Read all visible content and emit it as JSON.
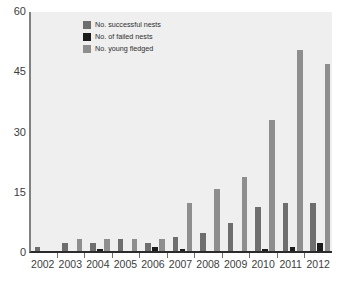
{
  "chart_data": {
    "type": "bar",
    "title": "",
    "subtitle": "",
    "xlabel": "",
    "ylabel": "",
    "ylim": [
      0,
      60
    ],
    "yticks": [
      0,
      15,
      30,
      45,
      60
    ],
    "grid": false,
    "legend_position": "top-left-inside",
    "categories": [
      "2002",
      "2003",
      "2004",
      "2005",
      "2006",
      "2007",
      "2008",
      "2009",
      "2010",
      "2011",
      "2012"
    ],
    "series": [
      {
        "name": "No. successful nests",
        "color": "#6e6e6e",
        "values": [
          1,
          2,
          2,
          3,
          2,
          3.5,
          4.5,
          7,
          11,
          12,
          12
        ]
      },
      {
        "name": "No. of failed nests",
        "color": "#1c1c1c",
        "values": [
          0,
          0,
          0.5,
          0,
          1,
          0.5,
          0,
          0,
          0.5,
          1,
          2
        ]
      },
      {
        "name": "No. young fledged",
        "color": "#8e8e8e",
        "values": [
          0,
          3,
          3,
          3,
          3,
          12,
          15.5,
          18.5,
          32.5,
          50,
          46.5
        ]
      }
    ]
  },
  "axes": {
    "y_tick_labels": [
      "60",
      "45",
      "30",
      "15",
      "0"
    ],
    "x_tick_labels": [
      "2002",
      "2003",
      "2004",
      "2005",
      "2006",
      "2007",
      "2008",
      "2009",
      "2010",
      "2011",
      "2012"
    ]
  },
  "legend": {
    "items": [
      {
        "label": "No. successful nests",
        "color": "#6e6e6e"
      },
      {
        "label": "No. of failed nests",
        "color": "#1c1c1c"
      },
      {
        "label": "No. young fledged",
        "color": "#8e8e8e"
      }
    ]
  }
}
